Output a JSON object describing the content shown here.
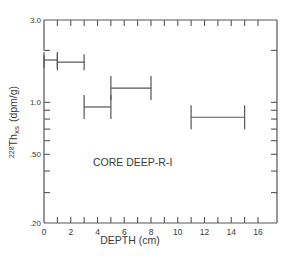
{
  "chart_data": {
    "type": "line",
    "subtype": "horizontal-interval-bars",
    "title": "",
    "annotation": "CORE DEEP-R-I",
    "xlabel": "DEPTH (cm)",
    "ylabel": {
      "isotope_mass": "228",
      "element": "Th",
      "subscript": "xs",
      "units": "(dpm/g)"
    },
    "xlim": [
      0,
      17.5
    ],
    "ylim": [
      0.2,
      3.0
    ],
    "yscale": "log",
    "grid": false,
    "x_ticks": [
      0,
      1,
      2,
      3,
      4,
      5,
      6,
      7,
      8,
      9,
      10,
      11,
      12,
      13,
      14,
      15,
      16
    ],
    "x_tick_labels": [
      {
        "value": 0,
        "label": "0"
      },
      {
        "value": 2,
        "label": "2"
      },
      {
        "value": 4,
        "label": "4"
      },
      {
        "value": 6,
        "label": "6"
      },
      {
        "value": 8,
        "label": "8"
      },
      {
        "value": 10,
        "label": "10"
      },
      {
        "value": 12,
        "label": "12"
      },
      {
        "value": 14,
        "label": "14"
      },
      {
        "value": 16,
        "label": "16"
      }
    ],
    "y_ticks": [
      3.0,
      2.0,
      1.0,
      0.9,
      0.8,
      0.7,
      0.6,
      0.5,
      0.4,
      0.3,
      0.2
    ],
    "y_tick_labels": [
      {
        "value": 3.0,
        "label": "3.0"
      },
      {
        "value": 1.0,
        "label": "1.0"
      },
      {
        "value": 0.5,
        "label": ".50"
      },
      {
        "value": 0.2,
        "label": ".20"
      }
    ],
    "series": [
      {
        "name": "228Th excess",
        "intervals": [
          {
            "depth_from": 0,
            "depth_to": 1,
            "value": 1.76
          },
          {
            "depth_from": 1,
            "depth_to": 3,
            "value": 1.71
          },
          {
            "depth_from": 3,
            "depth_to": 5,
            "value": 0.94
          },
          {
            "depth_from": 5,
            "depth_to": 8,
            "value": 1.21
          },
          {
            "depth_from": 11,
            "depth_to": 15,
            "value": 0.82
          }
        ]
      }
    ],
    "colors": {
      "line": "#555555",
      "text": "#3a3a3a",
      "background": "#ffffff"
    }
  }
}
